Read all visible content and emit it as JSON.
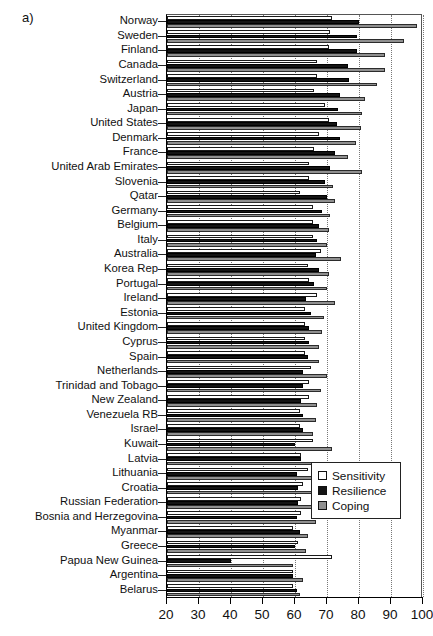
{
  "figure": {
    "panel_label": "a)"
  },
  "chart_data": {
    "type": "bar",
    "orientation": "horizontal",
    "title": "",
    "xlabel": "",
    "ylabel": "",
    "xlim": [
      20,
      100
    ],
    "xticks": [
      20,
      30,
      40,
      50,
      60,
      70,
      80,
      90,
      100
    ],
    "xticklabels": [
      "20",
      "30",
      "40",
      "50",
      "60",
      "70",
      "80",
      "90",
      "100"
    ],
    "grid": "vertical dotted gridlines at x ticks",
    "legend_position": "lower right, inside axes",
    "legend": [
      "Sensitivity",
      "Resilience",
      "Coping"
    ],
    "colors": {
      "Sensitivity": "#ffffff",
      "Resilience": "#141414",
      "Coping": "#8f8f8f",
      "edge": "#111111"
    },
    "categories": [
      "Norway",
      "Sweden",
      "Finland",
      "Canada",
      "Switzerland",
      "Austria",
      "Japan",
      "United States",
      "Denmark",
      "France",
      "United Arab Emirates",
      "Slovenia",
      "Qatar",
      "Germany",
      "Belgium",
      "Italy",
      "Australia",
      "Korea Rep",
      "Portugal",
      "Ireland",
      "Estonia",
      "United Kingdom",
      "Cyprus",
      "Spain",
      "Netherlands",
      "Trinidad and Tobago",
      "New Zealand",
      "Venezuela RB",
      "Israel",
      "Kuwait",
      "Latvia",
      "Lithuania",
      "Croatia",
      "Russian Federation",
      "Bosnia and Herzegovina",
      "Myanmar",
      "Greece",
      "Papua New Guinea",
      "Argentina",
      "Belarus"
    ],
    "series": [
      {
        "name": "Sensitivity",
        "values": [
          71.5,
          71.0,
          70.5,
          67.0,
          67.0,
          66.0,
          69.5,
          70.5,
          67.5,
          66.0,
          64.5,
          64.5,
          61.5,
          65.5,
          65.5,
          65.5,
          68.0,
          64.0,
          64.5,
          67.0,
          63.0,
          63.0,
          63.0,
          63.0,
          65.0,
          64.5,
          64.5,
          61.5,
          61.5,
          65.5,
          62.0,
          64.0,
          62.5,
          62.0,
          62.0,
          59.5,
          61.0,
          71.5,
          59.5,
          59.5
        ]
      },
      {
        "name": "Resilience",
        "values": [
          80.0,
          79.5,
          79.5,
          76.5,
          77.0,
          74.0,
          73.5,
          73.0,
          74.0,
          72.5,
          71.0,
          69.5,
          70.0,
          68.5,
          67.5,
          67.0,
          66.5,
          67.5,
          66.0,
          63.5,
          65.0,
          64.5,
          64.5,
          64.0,
          62.5,
          62.5,
          62.0,
          62.5,
          62.5,
          60.0,
          62.0,
          60.5,
          61.0,
          61.0,
          60.5,
          61.5,
          60.0,
          40.0,
          59.5,
          60.5
        ]
      },
      {
        "name": "Coping",
        "values": [
          98.0,
          94.0,
          88.0,
          88.0,
          85.5,
          82.0,
          81.0,
          80.5,
          79.0,
          76.5,
          81.0,
          72.0,
          72.5,
          71.0,
          70.5,
          70.0,
          74.5,
          70.5,
          70.0,
          72.5,
          69.0,
          68.5,
          67.5,
          67.5,
          70.0,
          68.0,
          67.0,
          66.5,
          65.5,
          71.5,
          65.5,
          67.5,
          66.0,
          66.5,
          66.5,
          64.0,
          63.5,
          59.5,
          62.5,
          61.5
        ]
      }
    ]
  }
}
